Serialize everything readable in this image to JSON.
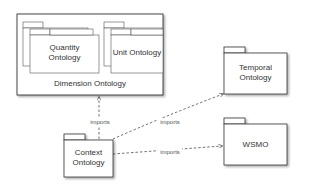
{
  "diagram": {
    "type": "UML package diagram",
    "packages": {
      "dimension": {
        "label": "Dimension Ontology"
      },
      "quantity": {
        "line1": "Quantity",
        "line2": "Ontology"
      },
      "unit": {
        "label": "Unit Ontology"
      },
      "context": {
        "line1": "Context",
        "line2": "Ontology"
      },
      "temporal": {
        "line1": "Temporal",
        "line2": "Ontology"
      },
      "wsmo": {
        "label": "WSMO"
      }
    },
    "dependencies": [
      {
        "from": "Context Ontology",
        "to": "Dimension Ontology",
        "label": "imports"
      },
      {
        "from": "Context Ontology",
        "to": "Temporal Ontology",
        "label": "imports"
      },
      {
        "from": "Context Ontology",
        "to": "WSMO",
        "label": "imports"
      }
    ],
    "colors": {
      "stroke": "#333333",
      "fill": "#ffffff",
      "shadow": "#bbbbbb"
    }
  }
}
